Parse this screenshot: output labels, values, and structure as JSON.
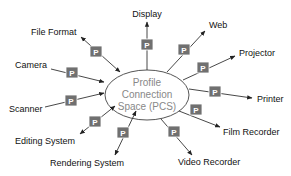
{
  "diagram": {
    "center": {
      "lines": [
        "Profile",
        "Connection",
        "Space (PCS)"
      ]
    },
    "profile_label": "P",
    "colors": {
      "profile_box": "#707070",
      "ellipse_stroke": "#555555",
      "center_text": "#888888",
      "label_text": "#111111"
    },
    "nodes": [
      {
        "label": "Display",
        "direction": "out"
      },
      {
        "label": "Web",
        "direction": "out"
      },
      {
        "label": "Projector",
        "direction": "out"
      },
      {
        "label": "Printer",
        "direction": "out"
      },
      {
        "label": "Film Recorder",
        "direction": "out"
      },
      {
        "label": "Video Recorder",
        "direction": "out"
      },
      {
        "label": "Rendering System",
        "direction": "both"
      },
      {
        "label": "Editing System",
        "direction": "both"
      },
      {
        "label": "Scanner",
        "direction": "in"
      },
      {
        "label": "Camera",
        "direction": "in"
      },
      {
        "label": "File Format",
        "direction": "both"
      }
    ]
  }
}
